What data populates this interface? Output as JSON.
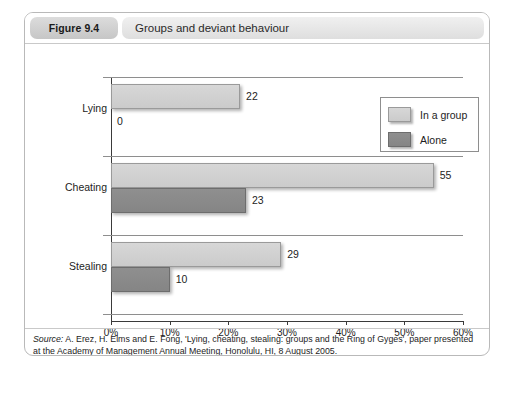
{
  "figure": {
    "number": "Figure 9.4",
    "title": "Groups and deviant behaviour",
    "source_label": "Source:",
    "source_text": " A. Erez, H. Elms and E. Fong, 'Lying, cheating, stealing: groups and the Ring of Gyges', paper presented at the Academy of Management Annual Meeting, Honolulu, HI, 8 August 2005."
  },
  "colors": {
    "in_a_group": "#d1d1d1",
    "alone": "#8a8a8a",
    "axis": "#3a3a3a",
    "separator": "#8e8e8e",
    "header_pill": "#d2d2d2",
    "border": "#b9b9b9"
  },
  "chart_data": {
    "type": "bar",
    "orientation": "horizontal",
    "title": "Groups and deviant behaviour",
    "xlabel": "",
    "ylabel": "",
    "categories": [
      "Lying",
      "Cheating",
      "Stealing"
    ],
    "series": [
      {
        "name": "In a group",
        "values": [
          22,
          55,
          29
        ],
        "color": "#d1d1d1"
      },
      {
        "name": "Alone",
        "values": [
          0,
          23,
          10
        ],
        "color": "#8a8a8a"
      }
    ],
    "xlim": [
      0,
      60
    ],
    "xticks": [
      0,
      10,
      20,
      30,
      40,
      50,
      60
    ],
    "xtick_labels": [
      "0%",
      "10%",
      "20%",
      "30%",
      "40%",
      "50%",
      "60%"
    ],
    "value_labels": [
      "22",
      "0",
      "55",
      "23",
      "29",
      "10"
    ],
    "grid": false,
    "category_separators": true,
    "legend_position": "top-right",
    "legend_entries": [
      "In a group",
      "Alone"
    ]
  }
}
